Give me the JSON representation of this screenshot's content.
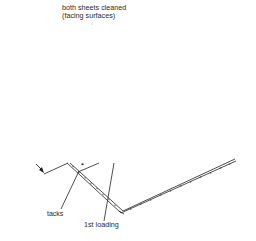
{
  "caption": {
    "line1": "both sheets cleaned",
    "line2": "(facing surfaces)"
  },
  "labels": {
    "tacks": "tacks",
    "first_loading": "1st loading"
  },
  "colors": {
    "line": "#222222",
    "background": "#ffffff"
  }
}
